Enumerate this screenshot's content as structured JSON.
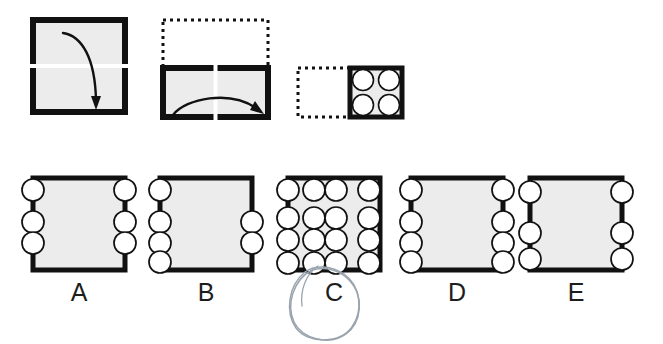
{
  "puzzle": {
    "type": "paper-folding-hole-punch",
    "title": "",
    "marked_answer": "C",
    "folds": [
      {
        "id": "fold-1",
        "shape": "square",
        "x": 33,
        "y": 20,
        "w": 92,
        "h": 92,
        "fold_line": "horizontal-midline",
        "fold_direction": "down",
        "ghost": false
      },
      {
        "id": "fold-2",
        "shape": "rectangle",
        "x": 163,
        "y": 68,
        "w": 105,
        "h": 49,
        "fold_line": "vertical-midline",
        "fold_direction": "right",
        "ghost_x": 163,
        "ghost_y": 20,
        "ghost_w": 105,
        "ghost_h": 48,
        "ghost": true
      },
      {
        "id": "fold-3",
        "shape": "square",
        "x": 350,
        "y": 68,
        "w": 52,
        "h": 49,
        "punches": 4,
        "punch_layout": "2x2",
        "ghost_x": 298,
        "ghost_y": 68,
        "ghost_w": 52,
        "ghost_h": 49,
        "ghost": true
      }
    ],
    "options": [
      {
        "label": "A",
        "x": 33,
        "y": 178,
        "w": 92,
        "h": 92,
        "hole_count": 6,
        "holes": [
          {
            "cx": 33,
            "cy": 190
          },
          {
            "cx": 33,
            "cy": 222
          },
          {
            "cx": 33,
            "cy": 243
          },
          {
            "cx": 125,
            "cy": 190
          },
          {
            "cx": 125,
            "cy": 222
          },
          {
            "cx": 125,
            "cy": 243
          }
        ]
      },
      {
        "label": "B",
        "x": 160,
        "y": 178,
        "w": 92,
        "h": 92,
        "hole_count": 6,
        "holes": [
          {
            "cx": 160,
            "cy": 190
          },
          {
            "cx": 160,
            "cy": 222
          },
          {
            "cx": 160,
            "cy": 243
          },
          {
            "cx": 160,
            "cy": 262
          },
          {
            "cx": 252,
            "cy": 222
          },
          {
            "cx": 252,
            "cy": 243
          }
        ]
      },
      {
        "label": "C",
        "x": 288,
        "y": 178,
        "w": 92,
        "h": 92,
        "hole_count": 16,
        "holes": [
          {
            "cx": 288,
            "cy": 190
          },
          {
            "cx": 319,
            "cy": 190
          },
          {
            "cx": 349,
            "cy": 190
          },
          {
            "cx": 380,
            "cy": 190
          },
          {
            "cx": 288,
            "cy": 218
          },
          {
            "cx": 319,
            "cy": 218
          },
          {
            "cx": 349,
            "cy": 218
          },
          {
            "cx": 380,
            "cy": 218
          },
          {
            "cx": 288,
            "cy": 240
          },
          {
            "cx": 319,
            "cy": 240
          },
          {
            "cx": 349,
            "cy": 240
          },
          {
            "cx": 380,
            "cy": 240
          },
          {
            "cx": 288,
            "cy": 266
          },
          {
            "cx": 319,
            "cy": 266
          },
          {
            "cx": 349,
            "cy": 266
          },
          {
            "cx": 380,
            "cy": 266
          }
        ]
      },
      {
        "label": "D",
        "x": 411,
        "y": 178,
        "w": 92,
        "h": 92,
        "hole_count": 8,
        "holes": [
          {
            "cx": 411,
            "cy": 190
          },
          {
            "cx": 411,
            "cy": 222
          },
          {
            "cx": 411,
            "cy": 243
          },
          {
            "cx": 411,
            "cy": 265
          },
          {
            "cx": 503,
            "cy": 190
          },
          {
            "cx": 503,
            "cy": 222
          },
          {
            "cx": 503,
            "cy": 243
          },
          {
            "cx": 503,
            "cy": 265
          }
        ]
      },
      {
        "label": "E",
        "x": 530,
        "y": 178,
        "w": 92,
        "h": 92,
        "hole_count": 6,
        "holes": [
          {
            "cx": 530,
            "cy": 192
          },
          {
            "cx": 530,
            "cy": 233
          },
          {
            "cx": 530,
            "cy": 262
          },
          {
            "cx": 622,
            "cy": 192
          },
          {
            "cx": 622,
            "cy": 233
          },
          {
            "cx": 622,
            "cy": 262
          }
        ]
      }
    ],
    "option_labels": [
      {
        "text": "A",
        "x": 59,
        "y": 280
      },
      {
        "text": "B",
        "x": 186,
        "y": 280
      },
      {
        "text": "C",
        "x": 314,
        "y": 280
      },
      {
        "text": "D",
        "x": 437,
        "y": 280
      },
      {
        "text": "E",
        "x": 556,
        "y": 280
      }
    ],
    "colors": {
      "paper_fill": "#ececec",
      "paper_stroke": "#111111",
      "ghost_stroke": "#111111",
      "hole_fill": "#ffffff",
      "hole_stroke": "#111111",
      "arrow": "#111111",
      "fold_line": "#ffffff",
      "label_text": "#1d1d1d",
      "annotation": "#9aa4ae",
      "background": "#ffffff"
    }
  }
}
